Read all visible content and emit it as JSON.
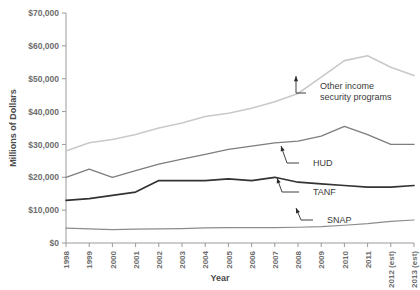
{
  "chart_data": {
    "type": "line",
    "title": "",
    "xlabel": "Year",
    "ylabel": "Millions of Dollars",
    "ylim": [
      0,
      70000
    ],
    "grid": false,
    "legend_position": "inline-annotations",
    "ytick_labels": [
      "$0",
      "$10,000",
      "$20,000",
      "$30,000",
      "$40,000",
      "$50,000",
      "$60,000",
      "$70,000"
    ],
    "ytick_values": [
      0,
      10000,
      20000,
      30000,
      40000,
      50000,
      60000,
      70000
    ],
    "categories": [
      "1998",
      "1999",
      "2000",
      "2001",
      "2002",
      "2003",
      "2004",
      "2005",
      "2006",
      "2007",
      "2008",
      "2009",
      "2010",
      "2011",
      "2012 (est)",
      "2013 (est)"
    ],
    "series": [
      {
        "name": "Other income security programs",
        "color": "#c9c9c9",
        "values": [
          28000,
          30500,
          31500,
          33000,
          35000,
          36500,
          38500,
          39500,
          41000,
          43000,
          45500,
          50500,
          55500,
          57000,
          53500,
          51000
        ]
      },
      {
        "name": "HUD",
        "color": "#7d7d7d",
        "values": [
          20000,
          22500,
          20000,
          22000,
          24000,
          25500,
          27000,
          28500,
          29500,
          30500,
          31000,
          32500,
          35500,
          33000,
          30000,
          30000
        ]
      },
      {
        "name": "TANF",
        "color": "#333333",
        "values": [
          13000,
          13500,
          14500,
          15500,
          19000,
          19000,
          19000,
          19500,
          19000,
          20000,
          18500,
          18000,
          17500,
          17000,
          17000,
          17500
        ]
      },
      {
        "name": "SNAP",
        "color": "#8c8c8c",
        "values": [
          4500,
          4300,
          4100,
          4200,
          4300,
          4400,
          4600,
          4700,
          4700,
          4700,
          4800,
          5000,
          5400,
          5900,
          6600,
          7000
        ]
      }
    ],
    "annotations": [
      {
        "label": "Other income security programs",
        "series": "Other income security programs"
      },
      {
        "label": "HUD",
        "series": "HUD"
      },
      {
        "label": "TANF",
        "series": "TANF"
      },
      {
        "label": "SNAP",
        "series": "SNAP"
      }
    ]
  }
}
